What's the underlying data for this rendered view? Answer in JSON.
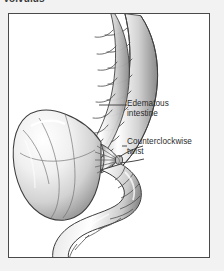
{
  "figure": {
    "title": "Volvulus",
    "frame": {
      "border_color": "#4a4a4a",
      "background_color": "#ffffff"
    },
    "page_background_color": "#f2f2f2",
    "illustration": {
      "name": "sigmoid-volvulus-anatomical-illustration",
      "style": "grayscale pencil / airbrush medical line drawing",
      "line_color": "#3a3a3a",
      "fill_light": "#ffffff",
      "fill_mid": "#d9d9d9",
      "fill_shadow": "#9a9a9a",
      "structures": [
        "haustrated descending colon entering from upper right",
        "massively distended edematous bowel loop at left",
        "pinched mesenteric twist point at center",
        "S-shaped sigmoid colon exiting lower center"
      ]
    },
    "callouts": [
      {
        "id": "edematous-intestine",
        "text": "Edematous\nintestine",
        "leader_from": [
          98,
          104
        ],
        "leader_to": [
          124,
          104
        ]
      },
      {
        "id": "counterclockwise-twist",
        "text": "Counterclockwise\ntwist",
        "leader_from": [
          101,
          145
        ],
        "leader_to": [
          124,
          145
        ]
      }
    ]
  }
}
